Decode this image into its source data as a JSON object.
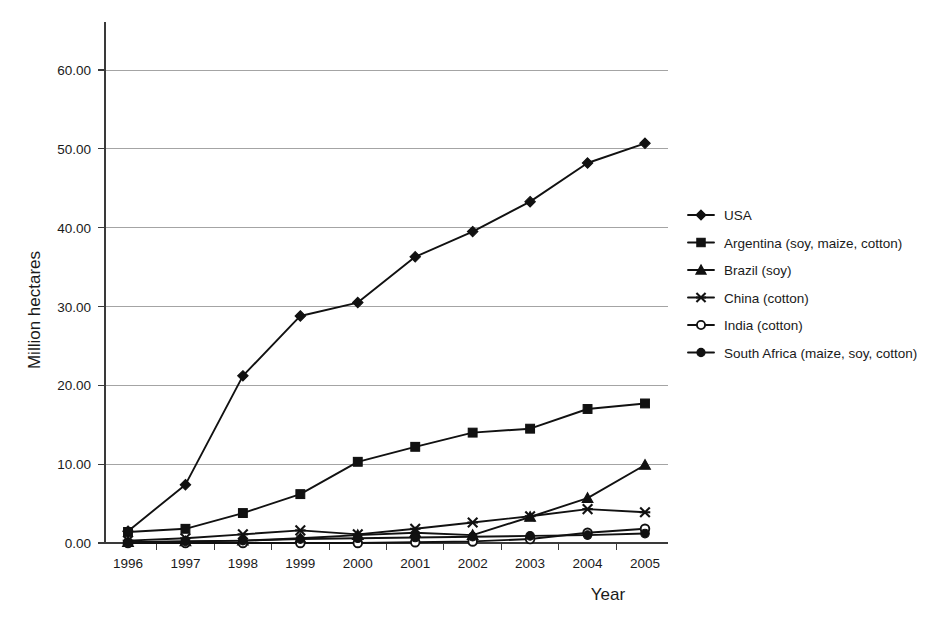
{
  "chart_data": {
    "type": "line",
    "title": "",
    "xlabel": "Year",
    "ylabel": "Million hectares",
    "categories": [
      "1996",
      "1997",
      "1998",
      "1999",
      "2000",
      "2001",
      "2002",
      "2003",
      "2004",
      "2005"
    ],
    "x": [
      1996,
      1997,
      1998,
      1999,
      2000,
      2001,
      2002,
      2003,
      2004,
      2005
    ],
    "ylim": [
      0,
      65
    ],
    "y_ticks": [
      0,
      10,
      20,
      30,
      40,
      50,
      60
    ],
    "y_tick_labels": [
      "0.00",
      "10.00",
      "20.00",
      "30.00",
      "40.00",
      "50.00",
      "60.00"
    ],
    "grid": "horizontal",
    "legend_position": "right",
    "series": [
      {
        "name": "USA",
        "marker": "diamond",
        "values": [
          1.5,
          7.4,
          21.2,
          28.8,
          30.5,
          36.3,
          39.5,
          43.3,
          48.2,
          50.7
        ]
      },
      {
        "name": "Argentina (soy, maize, cotton)",
        "marker": "square",
        "values": [
          1.4,
          1.8,
          3.8,
          6.2,
          10.3,
          12.2,
          14.0,
          14.5,
          17.0,
          17.7
        ]
      },
      {
        "name": "Brazil (soy)",
        "marker": "triangle",
        "values": [
          0.1,
          0.2,
          0.3,
          0.6,
          1.0,
          1.3,
          1.0,
          3.3,
          5.7,
          9.9
        ]
      },
      {
        "name": "China (cotton)",
        "marker": "x",
        "values": [
          0.3,
          0.6,
          1.1,
          1.6,
          1.1,
          1.8,
          2.6,
          3.4,
          4.3,
          3.9
        ]
      },
      {
        "name": "India (cotton)",
        "marker": "circle-open",
        "values": [
          0.0,
          0.0,
          0.0,
          0.0,
          0.0,
          0.1,
          0.2,
          0.5,
          1.3,
          1.8
        ]
      },
      {
        "name": "South Africa (maize, soy, cotton)",
        "marker": "circle-filled",
        "values": [
          0.1,
          0.2,
          0.3,
          0.5,
          0.6,
          0.7,
          0.8,
          0.9,
          1.0,
          1.2
        ]
      }
    ]
  },
  "axes": {
    "x_title": "Year",
    "y_title": "Million hectares"
  }
}
